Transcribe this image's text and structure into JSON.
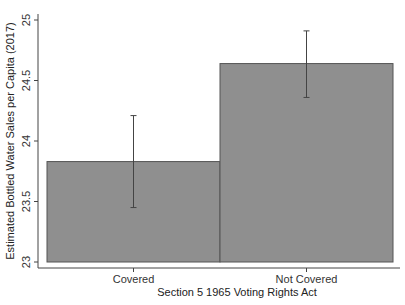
{
  "chart_data": {
    "type": "bar",
    "title": "",
    "xlabel": "Section 5 1965 Voting Rights Act",
    "ylabel": "Estimated Bottled Water  Sales per Capita (2017)",
    "categories": [
      "Covered",
      "Not Covered"
    ],
    "values": [
      23.83,
      24.64
    ],
    "error_bars": [
      {
        "low": 23.45,
        "high": 24.21
      },
      {
        "low": 24.36,
        "high": 24.91
      }
    ],
    "ylim": [
      23,
      25
    ],
    "yticks": [
      "23",
      "23.5",
      "24",
      "24.5",
      "25"
    ],
    "grid": false,
    "legend": null,
    "colors": {
      "bar_fill": "#8f8f8f",
      "bar_edge": "#555555",
      "error_bar": "#444444",
      "axis": "#444444"
    }
  }
}
